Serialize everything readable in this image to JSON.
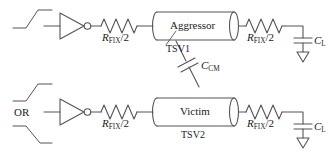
{
  "diagram": {
    "line_color": "#555555",
    "text_color": "#1a1a1a",
    "background": "#ffffff"
  },
  "aggressor_row": {
    "input_waveform": "rising-edge",
    "driver": "inverter",
    "resistor_left_label": "R",
    "resistor_left_sub": "FIX",
    "resistor_left_div": "/2",
    "tsv_block_label": "Aggressor",
    "tsv_name": "TSV1",
    "resistor_right_label": "R",
    "resistor_right_sub": "FIX",
    "resistor_right_div": "/2",
    "load_cap_label": "C",
    "load_cap_sub": "L",
    "ground": "ground-symbol"
  },
  "victim_row": {
    "input_waveform_top": "rising-edge",
    "input_waveform_bottom": "falling-edge",
    "input_or_label": "OR",
    "driver": "inverter",
    "resistor_left_label": "R",
    "resistor_left_sub": "FIX",
    "resistor_left_div": "/2",
    "tsv_block_label": "Victim",
    "tsv_name": "TSV2",
    "resistor_right_label": "R",
    "resistor_right_sub": "FIX",
    "resistor_right_div": "/2",
    "load_cap_label": "C",
    "load_cap_sub": "L",
    "ground": "ground-symbol"
  },
  "coupling": {
    "cap_label": "C",
    "cap_sub": "CM",
    "description": "coupling capacitor between TSV1 and TSV2"
  }
}
